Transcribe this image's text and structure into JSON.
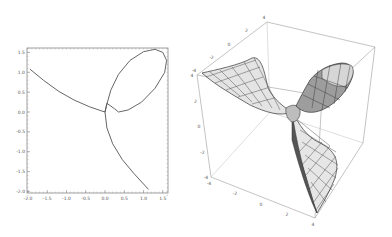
{
  "chart_data": [
    {
      "type": "line",
      "title": "",
      "xlabel": "",
      "ylabel": "",
      "xlim": [
        -2.0,
        1.7
      ],
      "ylim": [
        -2.1,
        1.65
      ],
      "grid": false,
      "frame": true,
      "x_ticks": [
        "-2.0",
        "-1.5",
        "-1.0",
        "-0.5",
        "0.0",
        "0.5",
        "1.0",
        "1.5"
      ],
      "y_ticks": [
        "1.5",
        "1.0",
        "0.5",
        "0.0",
        "-0.5",
        "-1.0",
        "-1.5",
        "-2.0"
      ],
      "series": [
        {
          "name": "parametric-curve",
          "color": "#555555",
          "points": [
            [
              -1.95,
              1.08
            ],
            [
              -1.6,
              0.8
            ],
            [
              -1.2,
              0.52
            ],
            [
              -0.8,
              0.3
            ],
            [
              -0.4,
              0.13
            ],
            [
              -0.1,
              0.03
            ],
            [
              0.0,
              0.0
            ],
            [
              0.05,
              0.2
            ],
            [
              0.15,
              0.55
            ],
            [
              0.35,
              0.95
            ],
            [
              0.65,
              1.3
            ],
            [
              1.0,
              1.52
            ],
            [
              1.3,
              1.58
            ],
            [
              1.5,
              1.5
            ],
            [
              1.6,
              1.3
            ],
            [
              1.55,
              1.0
            ],
            [
              1.3,
              0.6
            ],
            [
              0.95,
              0.25
            ],
            [
              0.6,
              0.05
            ],
            [
              0.35,
              0.0
            ],
            [
              0.25,
              0.08
            ],
            [
              0.05,
              0.22
            ],
            [
              0.0,
              0.0
            ],
            [
              0.05,
              -0.4
            ],
            [
              0.2,
              -0.8
            ],
            [
              0.45,
              -1.2
            ],
            [
              0.75,
              -1.55
            ],
            [
              1.13,
              -1.95
            ]
          ]
        }
      ]
    },
    {
      "type": "surface3d",
      "title": "",
      "axes": {
        "x": {
          "range": [
            -4,
            4
          ],
          "ticks": [
            "-4",
            "-2",
            "0",
            "2",
            "4"
          ]
        },
        "y": {
          "range": [
            -4,
            4
          ],
          "ticks": [
            "-4",
            "-2",
            "0",
            "2",
            "4"
          ]
        },
        "z": {
          "range": [
            -4,
            4
          ],
          "ticks": [
            "-4",
            "-2",
            "0",
            "2",
            "4"
          ]
        }
      },
      "box": true,
      "mesh": true,
      "surface_color": "#d8d8d8",
      "mesh_color": "#333333",
      "description": "Twisted saddle surface with three wings meeting at the origin; one lobe (upper right) is closed and shaded darker gray"
    }
  ],
  "labels": {
    "left_x_ticks": [
      "-2.0",
      "-1.5",
      "-1.0",
      "-0.5",
      "0.0",
      "0.5",
      "1.0",
      "1.5"
    ],
    "left_y_ticks": [
      "1.5",
      "1.0",
      "0.5",
      "0.0",
      "-0.5",
      "-1.0",
      "-1.5",
      "-2.0"
    ],
    "box_top_ticks": [
      "4",
      "2",
      "0",
      "-2",
      "-4"
    ],
    "box_left_ticks": [
      "4",
      "2",
      "0",
      "-2",
      "-4"
    ],
    "box_bottom_ticks": [
      "-4",
      "-2",
      "0",
      "2",
      "4"
    ]
  }
}
